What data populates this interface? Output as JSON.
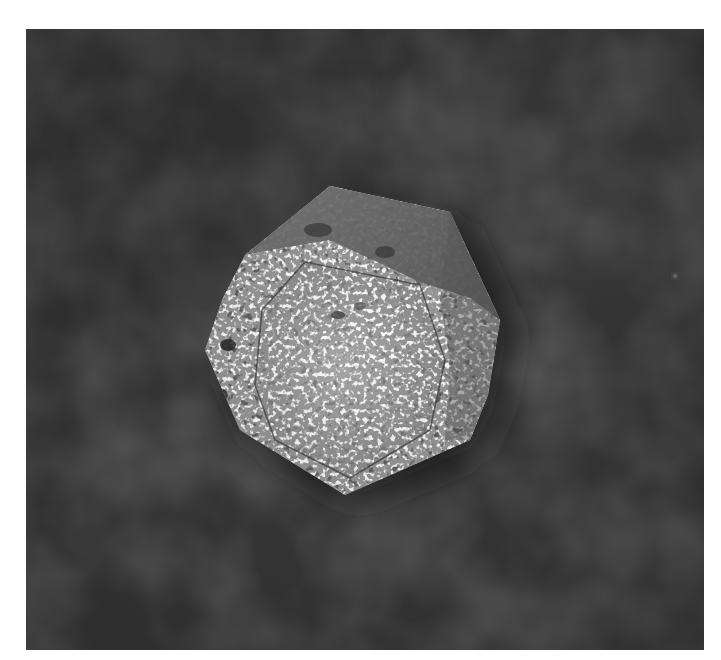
{
  "image": {
    "description": "Black-and-white photograph of a faceted, octagonal-outline speckled stone (polyhedral, dodecahedron-like) viewed from above on a dark mottled cloth background",
    "subject": "faceted speckled stone object",
    "background": "dark mottled fabric",
    "frame": {
      "x": 26,
      "y": 29,
      "width": 678,
      "height": 621,
      "border_color": "#ffffff"
    },
    "colors": {
      "background_dark": "#2e2e2e",
      "background_mid": "#454545",
      "background_light": "#555555",
      "stone_top_facet": "#6e6e6e",
      "stone_speckle": "#e8e8e8",
      "stone_face_base": "#9a9a9a",
      "stone_shadow": "#1e1e1e"
    },
    "features": {
      "outer_outline": [
        [
          330,
          186
        ],
        [
          450,
          212
        ],
        [
          500,
          320
        ],
        [
          488,
          395
        ],
        [
          470,
          440
        ],
        [
          345,
          495
        ],
        [
          240,
          430
        ],
        [
          205,
          350
        ],
        [
          222,
          300
        ],
        [
          245,
          255
        ]
      ],
      "inner_face": [
        [
          305,
          262
        ],
        [
          420,
          285
        ],
        [
          445,
          360
        ],
        [
          430,
          430
        ],
        [
          350,
          478
        ],
        [
          275,
          440
        ],
        [
          255,
          385
        ],
        [
          262,
          310
        ]
      ],
      "top_facet": [
        [
          330,
          186
        ],
        [
          450,
          212
        ],
        [
          500,
          320
        ],
        [
          470,
          300
        ],
        [
          420,
          285
        ],
        [
          305,
          262
        ],
        [
          250,
          260
        ],
        [
          245,
          255
        ]
      ],
      "bright_dot": {
        "x": 675,
        "y": 276,
        "r": 3
      }
    }
  }
}
